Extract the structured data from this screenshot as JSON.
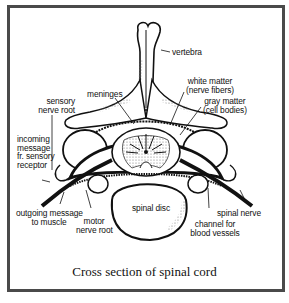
{
  "figure": {
    "caption": "Cross section of spinal cord",
    "labels": {
      "vertebra": "vertebra",
      "white_matter_1": "white matter",
      "white_matter_2": "(nerve fibers)",
      "gray_matter_1": "gray matter",
      "gray_matter_2": "(cell bodies)",
      "meninges": "meninges",
      "sensory_root_1": "sensory",
      "sensory_root_2": "nerve root",
      "incoming_1": "incoming",
      "incoming_2": "message",
      "incoming_3": "fr. sensory",
      "incoming_4": "receptor",
      "outgoing_1": "outgoing message",
      "outgoing_2": "to muscle",
      "motor_root_1": "motor",
      "motor_root_2": "nerve root",
      "spinal_disc": "spinal disc",
      "spinal_nerve": "spinal nerve",
      "channel_1": "channel for",
      "channel_2": "blood vessels"
    },
    "colors": {
      "ink": "#111111",
      "frame": "#4a4a4a",
      "stipple": "#9a9a9a",
      "background": "#ffffff"
    }
  }
}
